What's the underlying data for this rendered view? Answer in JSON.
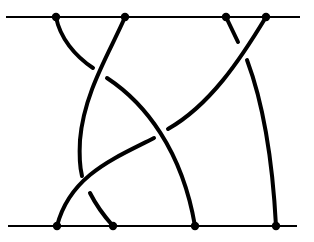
{
  "diagram": {
    "type": "braid",
    "strand_count": 4,
    "colors": {
      "stroke": "#000000",
      "background": "#ffffff"
    },
    "top_bar": {
      "x1": 6,
      "x2": 300,
      "y": 17
    },
    "bottom_bar": {
      "x1": 8,
      "x2": 297,
      "y": 226
    },
    "top_nodes": [
      {
        "x": 56,
        "y": 17
      },
      {
        "x": 125,
        "y": 17
      },
      {
        "x": 226,
        "y": 17
      },
      {
        "x": 266,
        "y": 17
      }
    ],
    "bottom_nodes": [
      {
        "x": 57,
        "y": 226
      },
      {
        "x": 113,
        "y": 226
      },
      {
        "x": 195,
        "y": 226
      },
      {
        "x": 276,
        "y": 226
      }
    ],
    "segments": [
      {
        "id": "strand-a-top",
        "d": "M56,17 C60,38 75,56 93,68"
      },
      {
        "id": "strand-a-bottom",
        "d": "M107,78 C145,103 182,150 195,226"
      },
      {
        "id": "strand-b-top",
        "d": "M125,17 C110,52 84,92 80,140 C79,158 80,168 82,176"
      },
      {
        "id": "strand-b-bottom",
        "d": "M90,193 C96,205 105,217 113,226"
      },
      {
        "id": "strand-c-top",
        "d": "M226,17 L238,42"
      },
      {
        "id": "strand-c-bottom",
        "d": "M247,60 C262,100 272,150 276,226"
      },
      {
        "id": "strand-d-top",
        "d": "M266,17 C240,60 210,105 168,129"
      },
      {
        "id": "strand-d-bottom",
        "d": "M154,138 C115,158 70,175 57,226"
      }
    ]
  }
}
